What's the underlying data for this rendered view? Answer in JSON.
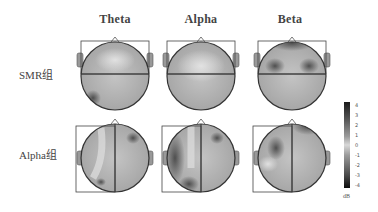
{
  "columns": [
    {
      "label": "Theta",
      "x": 115
    },
    {
      "label": "Alpha",
      "x": 201
    },
    {
      "label": "Beta",
      "x": 290
    }
  ],
  "rows": [
    {
      "label": "SMR组",
      "y": 67
    },
    {
      "label": "Alpha组",
      "y": 147
    }
  ],
  "colorbar": {
    "ticks": [
      "4",
      "3",
      "2",
      "1",
      "0",
      "-1",
      "-2",
      "-3",
      "-4"
    ],
    "unit": "dB",
    "range": [
      -4,
      4
    ]
  },
  "topomaps": [
    {
      "row": "SMR组",
      "band": "Theta",
      "divider": "horizontal"
    },
    {
      "row": "SMR组",
      "band": "Alpha",
      "divider": "horizontal"
    },
    {
      "row": "SMR组",
      "band": "Beta",
      "divider": "horizontal"
    },
    {
      "row": "Alpha组",
      "band": "Theta",
      "divider": "vertical"
    },
    {
      "row": "Alpha组",
      "band": "Alpha",
      "divider": "vertical"
    },
    {
      "row": "Alpha组",
      "band": "Beta",
      "divider": "vertical"
    }
  ]
}
